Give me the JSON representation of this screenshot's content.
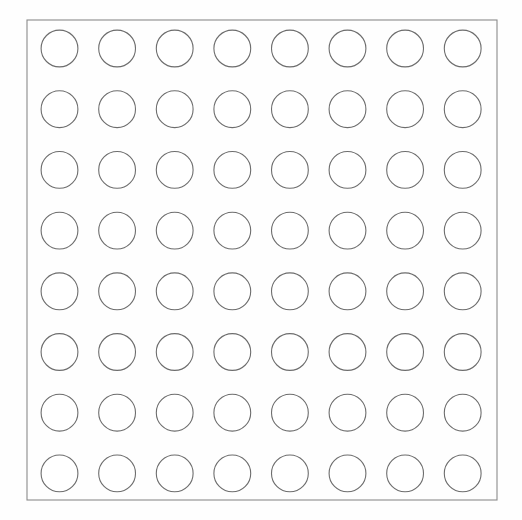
{
  "canvas": {
    "width": 522,
    "height": 520,
    "background_color": "#fefefe"
  },
  "diagram": {
    "panel": {
      "x": 27,
      "y": 20,
      "width": 470,
      "height": 480,
      "stroke_color": "#8a8a8a",
      "stroke_width": 1.1,
      "fill_color": "none"
    },
    "grid": {
      "rows": 8,
      "columns": 8,
      "total_circles": 64,
      "first_center_x": 59.5,
      "first_center_y": 48.5,
      "spacing_x": 57.6,
      "spacing_y": 60.7,
      "circle_radius": 18.4,
      "circle_stroke_color": "#6d6d6d",
      "circle_stroke_width": 1.1,
      "circle_fill_color": "#ffffff"
    }
  },
  "chart_data": {
    "type": "scatter",
    "title": "",
    "xlabel": "",
    "ylabel": "",
    "grid": false,
    "legend": "none",
    "xlim": [
      27,
      497
    ],
    "ylim": [
      20,
      500
    ],
    "marker": "open-circle",
    "marker_size": 37,
    "series": [
      {
        "name": "circles",
        "row_labels": [
          "row-1",
          "row-2",
          "row-3",
          "row-4",
          "row-5",
          "row-6",
          "row-7",
          "row-8"
        ],
        "column_labels": [
          "col-1",
          "col-2",
          "col-3",
          "col-4",
          "col-5",
          "col-6",
          "col-7",
          "col-8"
        ],
        "points": [
          [
            59.5,
            48.5
          ],
          [
            117.1,
            48.5
          ],
          [
            174.7,
            48.5
          ],
          [
            232.3,
            48.5
          ],
          [
            289.9,
            48.5
          ],
          [
            347.5,
            48.5
          ],
          [
            405.1,
            48.5
          ],
          [
            462.7,
            48.5
          ],
          [
            59.5,
            109.2
          ],
          [
            117.1,
            109.2
          ],
          [
            174.7,
            109.2
          ],
          [
            232.3,
            109.2
          ],
          [
            289.9,
            109.2
          ],
          [
            347.5,
            109.2
          ],
          [
            405.1,
            109.2
          ],
          [
            462.7,
            109.2
          ],
          [
            59.5,
            169.9
          ],
          [
            117.1,
            169.9
          ],
          [
            174.7,
            169.9
          ],
          [
            232.3,
            169.9
          ],
          [
            289.9,
            169.9
          ],
          [
            347.5,
            169.9
          ],
          [
            405.1,
            169.9
          ],
          [
            462.7,
            169.9
          ],
          [
            59.5,
            230.6
          ],
          [
            117.1,
            230.6
          ],
          [
            174.7,
            230.6
          ],
          [
            232.3,
            230.6
          ],
          [
            289.9,
            230.6
          ],
          [
            347.5,
            230.6
          ],
          [
            405.1,
            230.6
          ],
          [
            462.7,
            230.6
          ],
          [
            59.5,
            291.3
          ],
          [
            117.1,
            291.3
          ],
          [
            174.7,
            291.3
          ],
          [
            232.3,
            291.3
          ],
          [
            289.9,
            291.3
          ],
          [
            347.5,
            291.3
          ],
          [
            405.1,
            291.3
          ],
          [
            462.7,
            291.3
          ],
          [
            59.5,
            352.0
          ],
          [
            117.1,
            352.0
          ],
          [
            174.7,
            352.0
          ],
          [
            232.3,
            352.0
          ],
          [
            289.9,
            352.0
          ],
          [
            347.5,
            352.0
          ],
          [
            405.1,
            352.0
          ],
          [
            462.7,
            352.0
          ],
          [
            59.5,
            412.7
          ],
          [
            117.1,
            412.7
          ],
          [
            174.7,
            412.7
          ],
          [
            232.3,
            412.7
          ],
          [
            289.9,
            412.7
          ],
          [
            347.5,
            412.7
          ],
          [
            405.1,
            412.7
          ],
          [
            462.7,
            412.7
          ],
          [
            59.5,
            473.4
          ],
          [
            117.1,
            473.4
          ],
          [
            174.7,
            473.4
          ],
          [
            232.3,
            473.4
          ],
          [
            289.9,
            473.4
          ],
          [
            347.5,
            473.4
          ],
          [
            405.1,
            473.4
          ],
          [
            462.7,
            473.4
          ]
        ]
      }
    ]
  }
}
